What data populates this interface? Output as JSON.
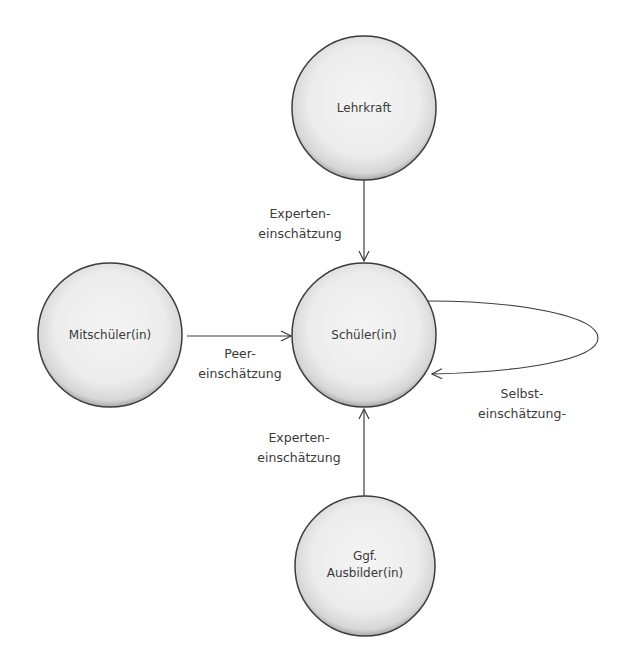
{
  "diagram": {
    "type": "assessment-relationship",
    "colors": {
      "node_fill_light": "#f4f4f4",
      "node_fill_dark": "#cfcfcf",
      "node_stroke": "#3c3c3c",
      "edge": "#3c3c3c",
      "text": "#3a3a3a"
    },
    "nodes": {
      "lehrkraft": {
        "lines": [
          "Lehrkraft"
        ]
      },
      "mitschueler": {
        "lines": [
          "Mitschüler(in)"
        ]
      },
      "schueler": {
        "lines": [
          "Schüler(in)"
        ]
      },
      "ausbilder": {
        "lines": [
          "Ggf.",
          "Ausbilder(in)"
        ]
      }
    },
    "edges": {
      "lehrkraft_to_schueler": {
        "lines": [
          "Experten-",
          "einschätzung"
        ]
      },
      "mitschueler_to_schueler": {
        "lines": [
          "Peer-",
          "einschätzung"
        ]
      },
      "ausbilder_to_schueler": {
        "lines": [
          "Experten-",
          "einschätzung"
        ]
      },
      "schueler_self": {
        "lines": [
          "Selbst-",
          "einschätzung-"
        ]
      }
    }
  }
}
